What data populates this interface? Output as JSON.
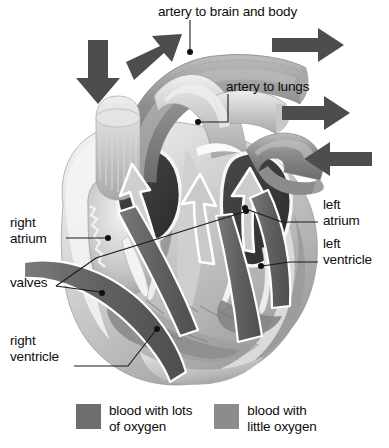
{
  "figure": {
    "title_visible": false
  },
  "labels": {
    "artery_to_brain_and_body": "artery to brain and body",
    "artery_to_lungs": "artery to lungs",
    "right_atrium": "right\natrium",
    "valves": "valves",
    "right_ventricle": "right\nventricle",
    "left_atrium": "left\natrium",
    "left_ventricle": "left\nventricle"
  },
  "legend": {
    "items": [
      {
        "label": "blood with lots\nof oxygen",
        "color": "#6e6e6e"
      },
      {
        "label": "blood with\nlittle oxygen",
        "color": "#8c8c8c"
      }
    ]
  },
  "colors": {
    "background": "#ffffff",
    "text": "#0d0d0d",
    "leader_line": "#1a1a1a",
    "flow_arrow_dark": "#5e5e5e",
    "heart_muscle_light": "#d9d9d9",
    "heart_muscle_mid": "#b3b3b3",
    "heart_muscle_dark": "#8f8f8f",
    "chamber_cavity": "#3a3a3a",
    "vessel_oxygen_rich": "#c9c9c9",
    "vessel_oxygen_poor": "#9a9a9a",
    "outline_white": "#f5f5f5"
  },
  "flow_arrows": {
    "external": [
      {
        "name": "vena-cava-inflow-arrow",
        "direction": "down",
        "note": "blood entering from body, upper left"
      },
      {
        "name": "aorta-outflow-arrow",
        "direction": "up-left",
        "note": "blood leaving to body"
      },
      {
        "name": "aorta-outflow-right-arrow",
        "direction": "right",
        "note": "blood leaving to brain and body"
      },
      {
        "name": "pulmonary-artery-outflow-arrow",
        "direction": "right",
        "note": "blood leaving to lungs"
      },
      {
        "name": "pulmonary-vein-inflow-arrow",
        "direction": "left",
        "note": "blood returning from lungs"
      }
    ],
    "internal": [
      {
        "name": "right-side-flow-arrow",
        "direction": "up"
      },
      {
        "name": "centre-flow-arrow",
        "direction": "up"
      },
      {
        "name": "left-side-flow-arrow",
        "direction": "up"
      },
      {
        "name": "right-inflow-arrow",
        "direction": "down-right"
      },
      {
        "name": "left-inflow-arrow",
        "direction": "down-left"
      }
    ]
  }
}
